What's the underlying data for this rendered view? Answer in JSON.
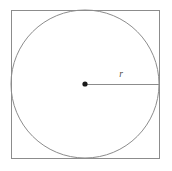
{
  "figure": {
    "canvas": {
      "width": 172,
      "height": 171,
      "background": "#ffffff"
    },
    "square": {
      "name": "square",
      "x": 11,
      "y": 10,
      "width": 148,
      "height": 148,
      "stroke": "#8c8c8c",
      "stroke_width": 1,
      "fill": "none"
    },
    "circle": {
      "name": "inscribed-circle",
      "cx": 85,
      "cy": 84,
      "r": 74,
      "stroke": "#8c8c8c",
      "stroke_width": 1,
      "fill": "none"
    },
    "center_point": {
      "name": "center-point",
      "cx": 85,
      "cy": 84,
      "r": 2.6,
      "fill": "#1a1a1a"
    },
    "radius_line": {
      "name": "radius-line",
      "x1": 85,
      "y1": 84,
      "x2": 159,
      "y2": 84,
      "stroke": "#8c8c8c",
      "stroke_width": 1
    },
    "radius_label": {
      "text": "r",
      "x": 121,
      "y": 77,
      "color": "#4a4a4a",
      "font_size": 9.5,
      "style": "italic"
    }
  }
}
